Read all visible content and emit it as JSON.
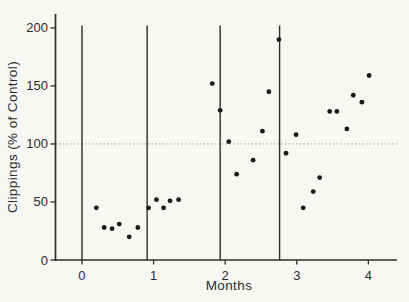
{
  "figure": {
    "background_color": "#f7f7f4",
    "ink_color": "#2d2d2d"
  },
  "chart_data": {
    "type": "scatter",
    "title": "",
    "xlabel": "Months",
    "ylabel": "Clippings (% of Control)",
    "x_tick_labels": [
      "0",
      "1",
      "2",
      "3",
      "4"
    ],
    "x_tick_values": [
      0,
      1,
      2,
      3,
      4
    ],
    "y_tick_labels": [
      "0",
      "50",
      "100",
      "150",
      "200"
    ],
    "y_tick_values": [
      0,
      50,
      100,
      150,
      200
    ],
    "xlim": [
      -0.37,
      4.4
    ],
    "ylim": [
      0,
      212
    ],
    "grid": false,
    "legend": "none",
    "reference_line": {
      "y": 100,
      "style": "dotted",
      "color": "#8f8f8f"
    },
    "event_lines_x": [
      0,
      0.91,
      1.93,
      2.76
    ],
    "event_line_top_y": 202,
    "series": [
      {
        "name": "clippings",
        "marker": "filled-circle",
        "color": "#1b1b1b",
        "points": [
          [
            0.2,
            45
          ],
          [
            0.31,
            28
          ],
          [
            0.42,
            27
          ],
          [
            0.52,
            31
          ],
          [
            0.66,
            20
          ],
          [
            0.78,
            28
          ],
          [
            0.93,
            45
          ],
          [
            1.04,
            52
          ],
          [
            1.14,
            45
          ],
          [
            1.23,
            51
          ],
          [
            1.35,
            52
          ],
          [
            1.82,
            152
          ],
          [
            1.93,
            129
          ],
          [
            2.05,
            102
          ],
          [
            2.16,
            74
          ],
          [
            2.39,
            86
          ],
          [
            2.52,
            111
          ],
          [
            2.61,
            145
          ],
          [
            2.75,
            190
          ],
          [
            2.85,
            92
          ],
          [
            2.99,
            108
          ],
          [
            3.09,
            45
          ],
          [
            3.23,
            59
          ],
          [
            3.32,
            71
          ],
          [
            3.46,
            128
          ],
          [
            3.56,
            128
          ],
          [
            3.7,
            113
          ],
          [
            3.79,
            142
          ],
          [
            3.91,
            136
          ],
          [
            4.01,
            159
          ]
        ]
      }
    ]
  }
}
